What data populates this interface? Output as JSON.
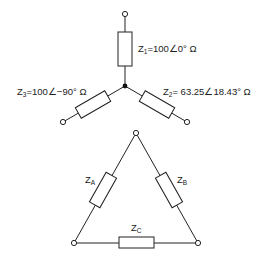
{
  "star": {
    "z1": {
      "symbol": "Z",
      "sub": "1",
      "value": "=100∠0° Ω"
    },
    "z2": {
      "symbol": "Z",
      "sub": "2",
      "value": "= 63.25∠18.43° Ω"
    },
    "z3": {
      "symbol": "Z",
      "sub": "3",
      "value": "=100∠−90° Ω"
    }
  },
  "delta": {
    "za": {
      "symbol": "Z",
      "sub": "A"
    },
    "zb": {
      "symbol": "Z",
      "sub": "B"
    },
    "zc": {
      "symbol": "Z",
      "sub": "C"
    }
  }
}
